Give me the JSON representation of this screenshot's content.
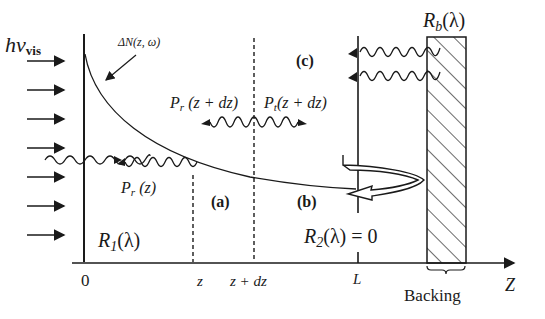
{
  "diagram": {
    "type": "reflection-absorption layer schematic",
    "incident_light": {
      "label_main": "hν",
      "label_sub": "vis",
      "arrow_count": 7
    },
    "excitation_profile": {
      "label": "ΔN(z, ω)",
      "shape": "exponential decay from z=0"
    },
    "regions": {
      "a": "(a)",
      "b": "(b)",
      "c": "(c)"
    },
    "waves": {
      "pr_z": "P",
      "pr_z_sub": "r",
      "pr_z_arg": " (z)",
      "pr_zdz": "P",
      "pr_zdz_sub": "r",
      "pr_zdz_arg": " (z + dz)",
      "pt_zdz": "P",
      "pt_zdz_sub": "t",
      "pt_zdz_arg": "(z + dz)"
    },
    "reflectances": {
      "r1_main": "R",
      "r1_sub": "1",
      "r1_arg": "(λ)",
      "r2_main": "R",
      "r2_sub": "2",
      "r2_arg": "(λ) = 0",
      "rb_main": "R",
      "rb_sub": "b",
      "rb_arg": "(λ)"
    },
    "axis": {
      "ticks": [
        "0",
        "z",
        "z + dz",
        "L"
      ],
      "axis_label": "Z",
      "backing_label": "Backing"
    }
  }
}
